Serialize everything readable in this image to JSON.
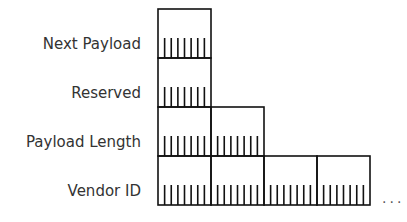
{
  "diagram": {
    "type": "byte-layout",
    "fields": [
      {
        "label": "Next Payload",
        "bytes": 1
      },
      {
        "label": "Reserved",
        "bytes": 1
      },
      {
        "label": "Payload Length",
        "bytes": 2
      },
      {
        "label": "Vendor ID",
        "bytes": 4,
        "continues": true
      }
    ],
    "bits_per_byte": 8,
    "continuation": "...",
    "colors": {
      "line": "#111111",
      "text": "#333333"
    }
  }
}
